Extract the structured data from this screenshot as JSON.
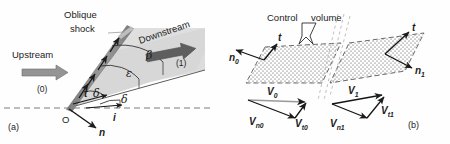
{
  "figure": {
    "background": "#fefefe",
    "width": 450,
    "height": 144
  },
  "colors": {
    "ink": "#1c1c1c",
    "shock_band": "#8a8a8a",
    "shock_band_edge": "#6f6f6f",
    "wedge_fill": "#d9d9d9",
    "block_arrow": "#909090",
    "dashed": "#707070",
    "stipple": "#3a3a3a",
    "faint_dash": "#b4b4b4"
  },
  "panel_a": {
    "label": "(a)",
    "labels": {
      "oblique": "Oblique",
      "shock": "shock",
      "upstream": "Upstream",
      "upstream_state": "(0)",
      "downstream": "Downstream",
      "downstream_state": "(1)",
      "origin": "O"
    },
    "vectors": [
      {
        "name": "tangent",
        "symbol": "t"
      },
      {
        "name": "normal",
        "symbol": "n"
      },
      {
        "name": "incident",
        "symbol": "i"
      }
    ],
    "angles": [
      {
        "name": "beta",
        "symbol": "β",
        "meaning": "shock angle"
      },
      {
        "name": "epsilon",
        "symbol": "ε",
        "meaning": "wedge-to-shock angle"
      },
      {
        "name": "delta-upper",
        "symbol": "δ",
        "meaning": "deflection angle"
      },
      {
        "name": "delta-lower",
        "symbol": "δ",
        "meaning": "deflection angle"
      }
    ]
  },
  "panel_b": {
    "label": "(b)",
    "labels": {
      "control": "Control",
      "volume": "volume"
    },
    "surface_vectors": [
      {
        "name": "normal-upstream",
        "base": "n",
        "sub": "0"
      },
      {
        "name": "tangent-upstream",
        "base": "t",
        "sub": ""
      },
      {
        "name": "tangent-downstream",
        "base": "t",
        "sub": ""
      },
      {
        "name": "normal-downstream",
        "base": "n",
        "sub": "1"
      }
    ],
    "velocity_triangles": [
      {
        "name": "upstream-triangle",
        "resultant": {
          "base": "V",
          "sub": "0"
        },
        "normal": {
          "base": "V",
          "sub": "n0"
        },
        "tangential": {
          "base": "V",
          "sub": "t0"
        }
      },
      {
        "name": "downstream-triangle",
        "resultant": {
          "base": "V",
          "sub": "1"
        },
        "normal": {
          "base": "V",
          "sub": "n1"
        },
        "tangential": {
          "base": "V",
          "sub": "t1"
        }
      }
    ]
  }
}
